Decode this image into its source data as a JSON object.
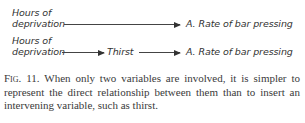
{
  "diagram": {
    "row1": {
      "source_line1": "Hours of",
      "source_line2": "deprivation",
      "target": "A.  Rate of bar pressing"
    },
    "row2": {
      "source_line1": "Hours of",
      "source_line2": "deprivation",
      "intermediate": "Thirst",
      "target": "A.  Rate of bar pressing"
    }
  },
  "caption": {
    "label": "Fig. 11.",
    "text": "When only two variables are involved, it is simpler to represent the direct relationship between them than to insert an intervening variable, such as thirst."
  }
}
